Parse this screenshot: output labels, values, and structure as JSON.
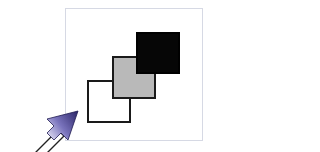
{
  "diagram": {
    "squares": [
      {
        "name": "white",
        "fill": "#ffffff"
      },
      {
        "name": "gray",
        "fill": "#b9b9b9"
      },
      {
        "name": "black",
        "fill": "#060606"
      }
    ],
    "frame_color": "#d6d9e4",
    "arrow": {
      "icon": "pointer-arrow-icon",
      "head_colors": [
        "#2e2a6e",
        "#8d88c9",
        "#e4e2f4"
      ]
    }
  }
}
